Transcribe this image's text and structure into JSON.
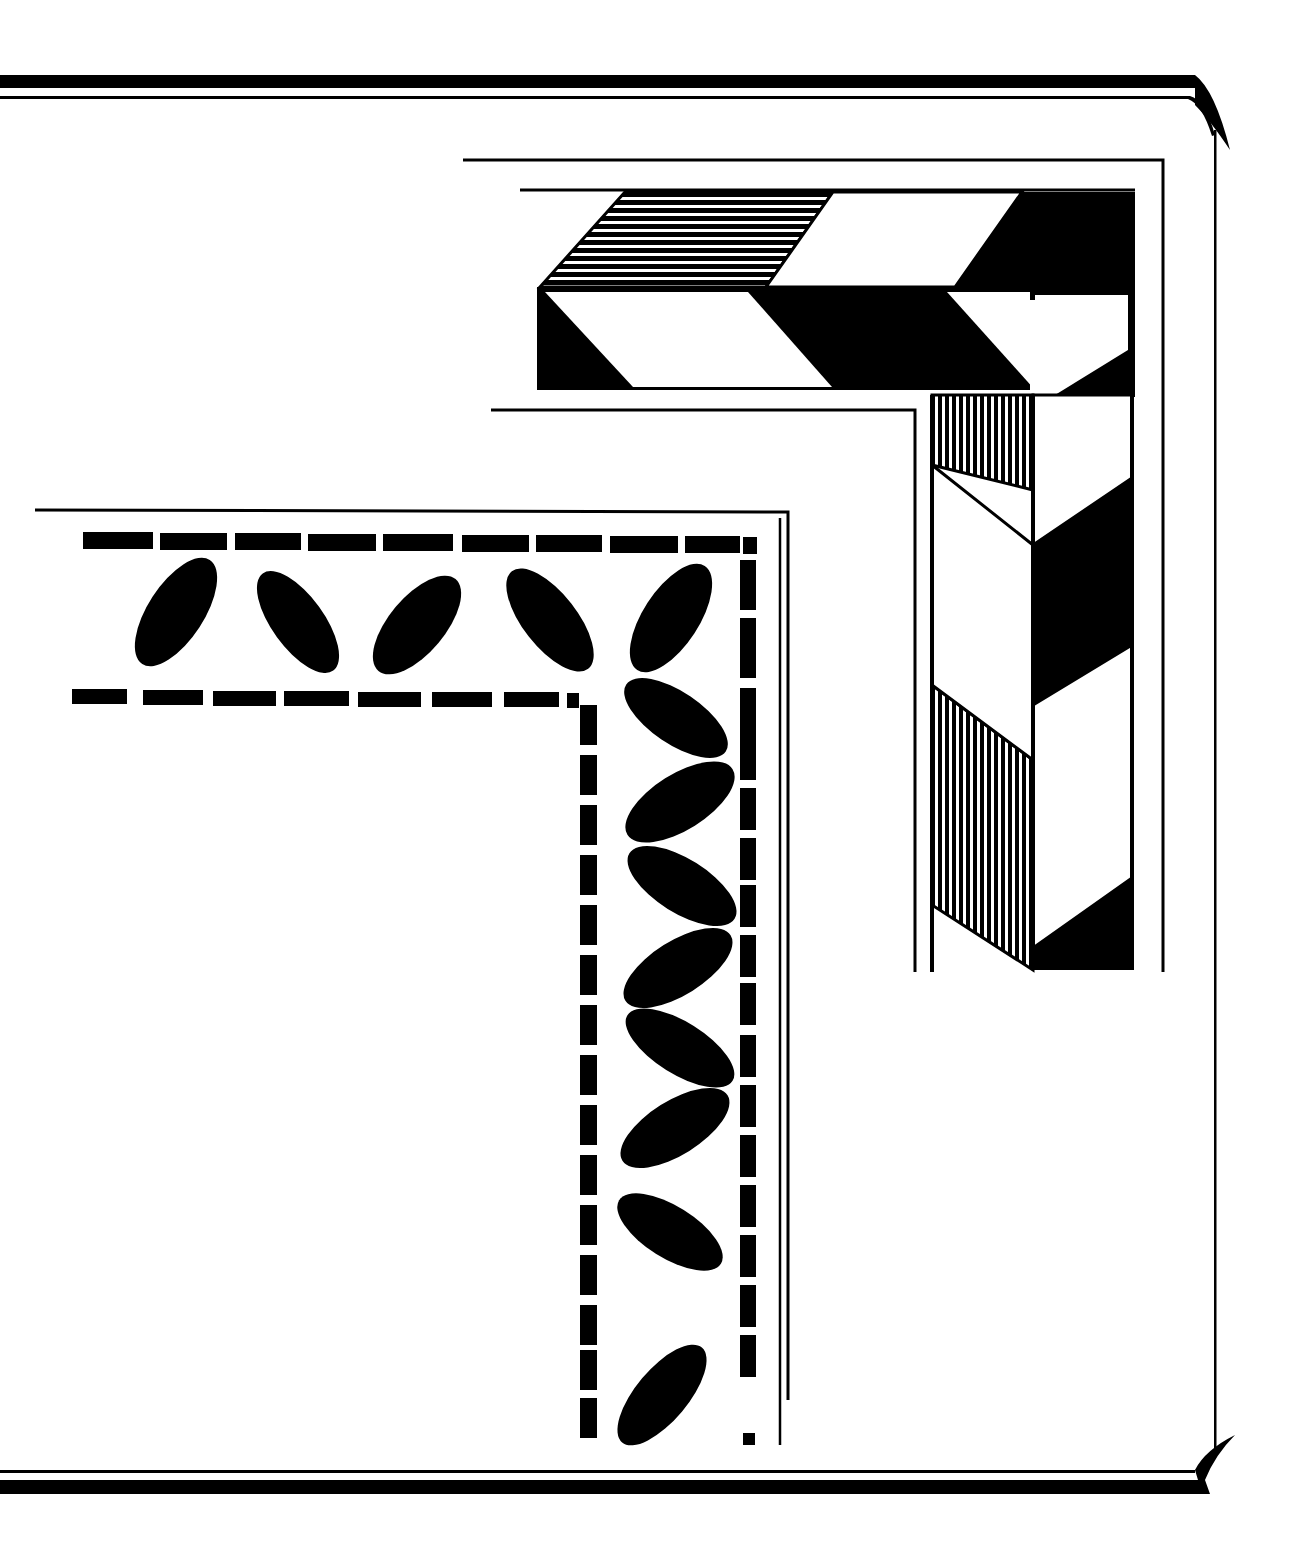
{
  "illustration": {
    "title": "Decorative corner borders",
    "description": "Black and white clip-art of two decorative L-shaped corner borders inside a double-ruled page frame with curled corner flourishes",
    "colors": {
      "ink": "#000000",
      "paper": "#ffffff"
    },
    "elements": {
      "frame": "double-rule page frame with curl flourishes at right",
      "border_a": "3D chevron / block band corner with hatched faces",
      "border_b": "leaf garland corner between dashed rules"
    }
  }
}
